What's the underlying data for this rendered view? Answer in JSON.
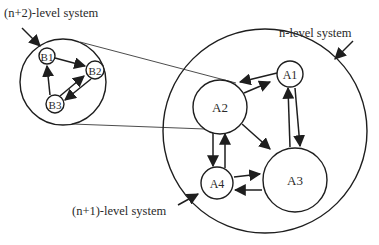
{
  "diagram": {
    "labels": {
      "n_plus_2": "(n+2)-level system",
      "n_level": "n-level system",
      "n_plus_1": "(n+1)-level system"
    },
    "subsystem_n_plus_2": {
      "nodes": [
        {
          "id": "B1",
          "label": "B1"
        },
        {
          "id": "B2",
          "label": "B2"
        },
        {
          "id": "B3",
          "label": "B3"
        }
      ],
      "edges": [
        {
          "from": "B1",
          "to": "B2"
        },
        {
          "from": "B3",
          "to": "B1"
        },
        {
          "from": "B3",
          "to": "B2"
        },
        {
          "from": "B2",
          "to": "B3"
        }
      ]
    },
    "system_n": {
      "nodes": [
        {
          "id": "A1",
          "label": "A1"
        },
        {
          "id": "A2",
          "label": "A2"
        },
        {
          "id": "A3",
          "label": "A3"
        },
        {
          "id": "A4",
          "label": "A4"
        }
      ],
      "edges": [
        {
          "from": "A1",
          "to": "A2"
        },
        {
          "from": "A2",
          "to": "A1"
        },
        {
          "from": "A3",
          "to": "A1"
        },
        {
          "from": "A1",
          "to": "A3"
        },
        {
          "from": "A2",
          "to": "A3"
        },
        {
          "from": "A2",
          "to": "A4"
        },
        {
          "from": "A4",
          "to": "A2"
        },
        {
          "from": "A4",
          "to": "A3"
        },
        {
          "from": "A3",
          "to": "A4"
        }
      ]
    },
    "zoom_relation": {
      "from": "A2",
      "to": "(n+2)-level system"
    }
  }
}
